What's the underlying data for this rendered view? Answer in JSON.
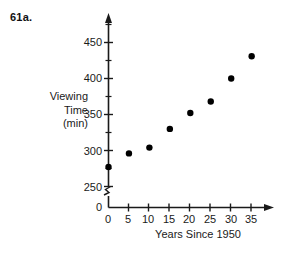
{
  "problem": {
    "label": "61a."
  },
  "chart_data": {
    "type": "scatter",
    "title": "",
    "xlabel": "Years Since 1950",
    "ylabel": "Viewing Time (min)",
    "ylabel_lines": [
      "Viewing",
      "Time",
      "(min)"
    ],
    "x": [
      0,
      5,
      10,
      15,
      20,
      25,
      30,
      35
    ],
    "values": [
      277,
      296,
      304,
      330,
      352,
      368,
      400,
      431
    ],
    "points": [
      {
        "x": 0,
        "y": 277
      },
      {
        "x": 5,
        "y": 296
      },
      {
        "x": 10,
        "y": 304
      },
      {
        "x": 15,
        "y": 330
      },
      {
        "x": 20,
        "y": 352
      },
      {
        "x": 25,
        "y": 368
      },
      {
        "x": 30,
        "y": 400
      },
      {
        "x": 35,
        "y": 431
      }
    ],
    "xlim": [
      0,
      35
    ],
    "ylim": [
      250,
      462
    ],
    "xticks": [
      0,
      5,
      10,
      15,
      20,
      25,
      30,
      35
    ],
    "xtick_labels": [
      "0",
      "5",
      "10",
      "15",
      "20",
      "25",
      "30",
      "35"
    ],
    "yticks": [
      250,
      300,
      350,
      400,
      450
    ],
    "ytick_labels": [
      "250",
      "300",
      "350",
      "400",
      "450"
    ],
    "y_minor_ticks": [
      275,
      325,
      375,
      425,
      450
    ],
    "y_origin_label": "0",
    "axis_break": true,
    "grid": false,
    "legend": null,
    "marker": "filled-circle",
    "marker_color": "#000000",
    "axis_color": "#1a1a1a"
  }
}
